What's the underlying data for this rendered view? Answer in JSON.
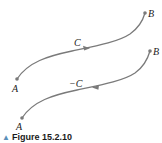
{
  "figure": {
    "caption_marker": "▲",
    "caption": "Figure 15.2.10",
    "stroke_color": "#7a7a7a"
  },
  "curves": [
    {
      "name": "C",
      "label": "C",
      "start_label": "A",
      "end_label": "B",
      "direction": "A to B"
    },
    {
      "name": "minus-C",
      "label": "−C",
      "start_label": "A",
      "end_label": "B",
      "direction": "B to A"
    }
  ]
}
